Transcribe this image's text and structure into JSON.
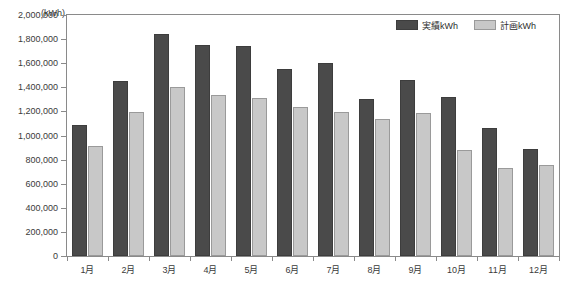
{
  "chart_data": {
    "type": "bar",
    "title": "",
    "xlabel": "",
    "ylabel": "(kWh)",
    "unit_label": "(kWh)",
    "ylim": [
      0,
      2000000
    ],
    "ytick_step": 200000,
    "grid": false,
    "legend_position": "top-right",
    "categories": [
      "1月",
      "2月",
      "3月",
      "4月",
      "5月",
      "6月",
      "7月",
      "8月",
      "9月",
      "10月",
      "11月",
      "12月"
    ],
    "ytick_labels": [
      "0",
      "200,000",
      "400,000",
      "600,000",
      "800,000",
      "1,000,000",
      "1,200,000",
      "1,400,000",
      "1,600,000",
      "1,800,000",
      "2,000,000"
    ],
    "ytick_values": [
      0,
      200000,
      400000,
      600000,
      800000,
      1000000,
      1200000,
      1400000,
      1600000,
      1800000,
      2000000
    ],
    "series": [
      {
        "name": "実績kWh",
        "color": "#4a4a4a",
        "values": [
          1085000,
          1450000,
          1840000,
          1755000,
          1740000,
          1550000,
          1600000,
          1300000,
          1460000,
          1320000,
          1060000,
          890000
        ]
      },
      {
        "name": "計画kWh",
        "color": "#c8c8c8",
        "values": [
          915000,
          1195000,
          1405000,
          1335000,
          1310000,
          1240000,
          1195000,
          1135000,
          1190000,
          880000,
          730000,
          755000
        ]
      }
    ]
  },
  "legend": {
    "entries": [
      {
        "label": "実績kWh",
        "swatch": "dark-swatch-icon"
      },
      {
        "label": "計画kWh",
        "swatch": "light-swatch-icon"
      }
    ]
  },
  "colors": {
    "actual": "#4a4a4a",
    "plan": "#c8c8c8",
    "axis": "#8a8a8a",
    "text": "#3a3a3a",
    "background": "#ffffff"
  }
}
